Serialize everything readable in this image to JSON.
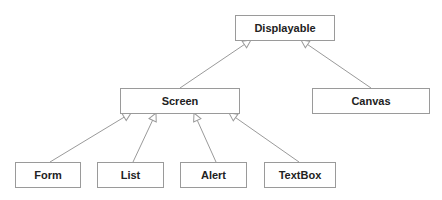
{
  "diagram": {
    "type": "class-inheritance",
    "nodes": [
      {
        "id": "displayable",
        "label": "Displayable"
      },
      {
        "id": "screen",
        "label": "Screen"
      },
      {
        "id": "canvas",
        "label": "Canvas"
      },
      {
        "id": "form",
        "label": "Form"
      },
      {
        "id": "list",
        "label": "List"
      },
      {
        "id": "alert",
        "label": "Alert"
      },
      {
        "id": "textbox",
        "label": "TextBox"
      }
    ],
    "edges": [
      {
        "from": "screen",
        "to": "displayable",
        "kind": "generalization"
      },
      {
        "from": "canvas",
        "to": "displayable",
        "kind": "generalization"
      },
      {
        "from": "form",
        "to": "screen",
        "kind": "generalization"
      },
      {
        "from": "list",
        "to": "screen",
        "kind": "generalization"
      },
      {
        "from": "alert",
        "to": "screen",
        "kind": "generalization"
      },
      {
        "from": "textbox",
        "to": "screen",
        "kind": "generalization"
      }
    ],
    "colors": {
      "line": "#9a9a9a",
      "text": "#222222",
      "background": "#ffffff"
    }
  }
}
